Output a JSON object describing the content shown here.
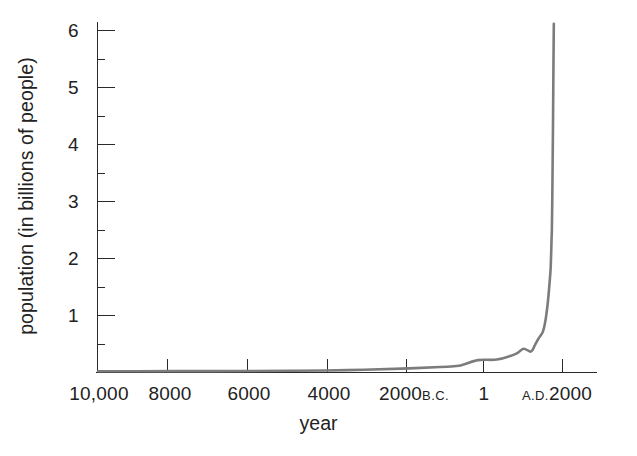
{
  "chart_data": {
    "type": "line",
    "title": "",
    "subtitle": "",
    "xlabel": "year",
    "ylabel": "population (in billions of people)",
    "x_tick_labels": [
      "10,000",
      "8000",
      "6000",
      "4000",
      "2000",
      "1",
      "2000"
    ],
    "x_tick_era": [
      "",
      "",
      "",
      "",
      "B.C.",
      "",
      "A.D."
    ],
    "x_tick_values": [
      -10000,
      -8000,
      -6000,
      -4000,
      -2000,
      1,
      2000
    ],
    "xlim": [
      -10000,
      2400
    ],
    "y_tick_labels": [
      "1",
      "2",
      "3",
      "4",
      "5",
      "6"
    ],
    "y_tick_values": [
      1,
      2,
      3,
      4,
      5,
      6
    ],
    "y_minor_tick_values": [
      0.5,
      1.5,
      2.5,
      3.5,
      4.5,
      5.5
    ],
    "ylim": [
      0,
      6.4
    ],
    "grid": false,
    "legend": "none",
    "series": [
      {
        "name": "world population",
        "color": "#7c7c7c",
        "x": [
          -10000,
          -9000,
          -8000,
          -7000,
          -6000,
          -5000,
          -4000,
          -3000,
          -2000,
          -1000,
          -500,
          1,
          500,
          1000,
          1200,
          1400,
          1500,
          1600,
          1700,
          1750,
          1800,
          1850,
          1900,
          1920,
          1940,
          1950,
          1960,
          1970,
          1980,
          1990,
          1999,
          2000
        ],
        "values": [
          0.004,
          0.005,
          0.006,
          0.007,
          0.008,
          0.012,
          0.018,
          0.03,
          0.05,
          0.08,
          0.1,
          0.2,
          0.21,
          0.31,
          0.4,
          0.35,
          0.46,
          0.58,
          0.68,
          0.79,
          0.98,
          1.26,
          1.65,
          1.86,
          2.3,
          2.52,
          3.03,
          3.7,
          4.44,
          5.32,
          6.0,
          6.1
        ]
      }
    ],
    "annotations": []
  },
  "axes": {
    "y_axis_name": "vertical-axis",
    "x_axis_name": "horizontal-axis"
  }
}
